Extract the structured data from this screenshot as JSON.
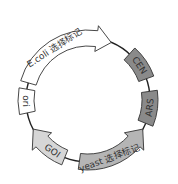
{
  "diagram": {
    "type": "plasmid-map",
    "center": [
      88,
      100
    ],
    "radius": 62,
    "backbone_color": "#222222",
    "features": [
      {
        "id": "ecoli",
        "label": "E.coli 选择标记",
        "kind": "arrow",
        "direction": "clockwise",
        "start_deg": 196,
        "end_deg": 292,
        "fill": "#ffffff"
      },
      {
        "id": "cen",
        "label": "CEN",
        "kind": "box",
        "start_deg": 312,
        "end_deg": 340,
        "fill": "#8a8a8a"
      },
      {
        "id": "ars",
        "label": "ARS",
        "kind": "box",
        "start_deg": 352,
        "end_deg": 22,
        "fill": "#8a8a8a"
      },
      {
        "id": "yeast",
        "label": "yeast 选择标记",
        "kind": "arrow",
        "direction": "counterclockwise",
        "start_deg": 98,
        "end_deg": 28,
        "fill": "#b5b5b5"
      },
      {
        "id": "goi",
        "label": "GOI",
        "kind": "arrow",
        "direction": "clockwise",
        "start_deg": 112,
        "end_deg": 152,
        "fill": "#d6d6d6"
      },
      {
        "id": "ori",
        "label": "ori",
        "kind": "box",
        "start_deg": 168,
        "end_deg": 190,
        "fill": "#ffffff"
      }
    ]
  }
}
